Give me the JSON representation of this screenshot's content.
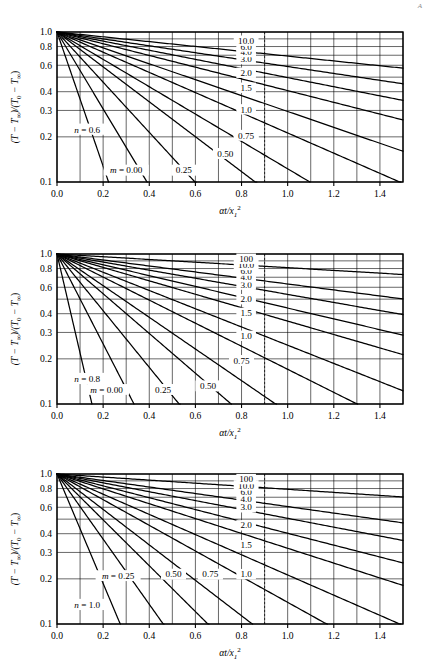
{
  "page": {
    "corner_mark": "A"
  },
  "axes": {
    "ylabel": "(T − T∞)/(T0 − T∞)",
    "xlabel": "αt/x1²",
    "ylabel_parts": {
      "t1": "(T − T",
      "sub1": "∞",
      "t2": ")/(T",
      "sub2": "0",
      "t3": " − T",
      "sub3": "∞",
      "t4": ")"
    },
    "xlabel_parts": {
      "alpha_t": "αt/x",
      "sub": "1",
      "sup": "2"
    },
    "y_ticks": [
      "1.0",
      "0.8",
      "0.6",
      "0.4",
      "0.3",
      "0.2",
      "0.1"
    ],
    "y_tick_values": [
      1.0,
      0.8,
      0.6,
      0.4,
      0.3,
      0.2,
      0.1
    ],
    "x_ticks": [
      "0.0",
      "0.2",
      "0.4",
      "0.6",
      "0.8",
      "1.0",
      "1.2",
      "1.4"
    ],
    "x_tick_values": [
      0.0,
      0.2,
      0.4,
      0.6,
      0.8,
      1.0,
      1.2,
      1.4
    ],
    "xlim": [
      0.0,
      1.5
    ],
    "ylim": [
      0.1,
      1.0
    ],
    "yscale": "log",
    "xgrid_step": 0.1,
    "ygrid_values": [
      0.1,
      0.2,
      0.3,
      0.4,
      0.5,
      0.6,
      0.7,
      0.8,
      0.9,
      1.0
    ],
    "m_prefix": "m = ",
    "n_prefix": "n = "
  },
  "chart_data": [
    {
      "type": "line",
      "id": "chart-n-0-6",
      "title": "n = 0.6",
      "n": "0.6",
      "xlabel": "αt/x1²",
      "ylabel": "(T − T∞)/(T0 − T∞)",
      "xlim": [
        0.0,
        1.5
      ],
      "ylim": [
        0.1,
        1.0
      ],
      "yscale": "log",
      "grid": true,
      "legend": "inline-curve-labels",
      "label_column_x": 0.9,
      "curve_labels": [
        "10.0",
        "6.0",
        "4.0",
        "3.0",
        "2.0",
        "1.5",
        "1.0",
        "0.75",
        "0.50",
        "0.25",
        "0.00"
      ],
      "m_labels_on_axis": [
        "0.00",
        "0.25",
        "0.50",
        "0.75"
      ],
      "series": [
        {
          "name": "0.00",
          "m": 0.0,
          "label_x": 0.3,
          "label_y": 0.12,
          "x_end": 0.365,
          "y_end": 0.1,
          "decay": 10.3
        },
        {
          "name": "0.25",
          "m": 0.25,
          "label_x": 0.55,
          "label_y": 0.12,
          "x_end": 0.625,
          "y_end": 0.1,
          "decay": 5.9
        },
        {
          "name": "0.50",
          "m": 0.5,
          "label_x": 0.73,
          "label_y": 0.155,
          "x_end": 0.92,
          "y_end": 0.1,
          "decay": 3.85
        },
        {
          "name": "0.75",
          "m": 0.75,
          "label_x": 0.82,
          "label_y": 0.205,
          "x_end": 1.26,
          "y_end": 0.1,
          "decay": 2.68
        },
        {
          "name": "1.0",
          "m": 1.0,
          "label_x": 0.82,
          "label_y": 0.305,
          "x_end": 1.5,
          "y_end": 0.115,
          "decay": 2.1
        },
        {
          "name": "1.5",
          "m": 1.5,
          "label_x": 0.82,
          "label_y": 0.425,
          "x_end": 1.5,
          "y_end": 0.2,
          "decay": 1.55
        },
        {
          "name": "2.0",
          "m": 2.0,
          "label_x": 0.82,
          "label_y": 0.535,
          "x_end": 1.5,
          "y_end": 0.3,
          "decay": 1.22
        },
        {
          "name": "3.0",
          "m": 3.0,
          "label_x": 0.82,
          "label_y": 0.66,
          "x_end": 1.5,
          "y_end": 0.435,
          "decay": 0.9
        },
        {
          "name": "4.0",
          "m": 4.0,
          "label_x": 0.82,
          "label_y": 0.735,
          "x_end": 1.5,
          "y_end": 0.535,
          "decay": 0.7
        },
        {
          "name": "6.0",
          "m": 6.0,
          "label_x": 0.82,
          "label_y": 0.8,
          "x_end": 1.5,
          "y_end": 0.64,
          "decay": 0.53
        },
        {
          "name": "10.0",
          "m": 10.0,
          "label_x": 0.82,
          "label_y": 0.875,
          "x_end": 1.5,
          "y_end": 0.76,
          "decay": 0.37
        }
      ]
    },
    {
      "type": "line",
      "id": "chart-n-0-8",
      "title": "n = 0.8",
      "n": "0.8",
      "xlabel": "αt/x1²",
      "ylabel": "(T − T∞)/(T0 − T∞)",
      "xlim": [
        0.0,
        1.5
      ],
      "ylim": [
        0.1,
        1.0
      ],
      "yscale": "log",
      "grid": true,
      "legend": "inline-curve-labels",
      "label_column_x": 0.9,
      "curve_labels": [
        "100",
        "10.0",
        "6.0",
        "4.0",
        "3.0",
        "2.0",
        "1.5",
        "1.0",
        "0.75",
        "0.50",
        "0.25",
        "0.00"
      ],
      "m_labels_on_axis": [
        "0.00",
        "0.25",
        "0.50",
        "0.75"
      ],
      "series": [
        {
          "name": "0.00",
          "m": 0.0,
          "label_x": 0.215,
          "label_y": 0.125,
          "x_end": 0.25,
          "y_end": 0.1,
          "decay": 15.2
        },
        {
          "name": "0.25",
          "m": 0.25,
          "label_x": 0.46,
          "label_y": 0.125,
          "x_end": 0.545,
          "y_end": 0.1,
          "decay": 6.9
        },
        {
          "name": "0.50",
          "m": 0.5,
          "label_x": 0.655,
          "label_y": 0.132,
          "x_end": 0.83,
          "y_end": 0.1,
          "decay": 4.35
        },
        {
          "name": "0.75",
          "m": 0.75,
          "label_x": 0.8,
          "label_y": 0.195,
          "x_end": 1.13,
          "y_end": 0.1,
          "decay": 3.05
        },
        {
          "name": "1.0",
          "m": 1.0,
          "label_x": 0.82,
          "label_y": 0.285,
          "x_end": 1.41,
          "y_end": 0.1,
          "decay": 2.43
        },
        {
          "name": "1.5",
          "m": 1.5,
          "label_x": 0.82,
          "label_y": 0.405,
          "x_end": 1.5,
          "y_end": 0.155,
          "decay": 1.77
        },
        {
          "name": "2.0",
          "m": 2.0,
          "label_x": 0.82,
          "label_y": 0.5,
          "x_end": 1.5,
          "y_end": 0.245,
          "decay": 1.4
        },
        {
          "name": "3.0",
          "m": 3.0,
          "label_x": 0.82,
          "label_y": 0.625,
          "x_end": 1.5,
          "y_end": 0.385,
          "decay": 1.03
        },
        {
          "name": "4.0",
          "m": 4.0,
          "label_x": 0.82,
          "label_y": 0.7,
          "x_end": 1.5,
          "y_end": 0.475,
          "decay": 0.83
        },
        {
          "name": "6.0",
          "m": 6.0,
          "label_x": 0.82,
          "label_y": 0.775,
          "x_end": 1.5,
          "y_end": 0.6,
          "decay": 0.62
        },
        {
          "name": "10.0",
          "m": 10.0,
          "label_x": 0.82,
          "label_y": 0.845,
          "x_end": 1.5,
          "y_end": 0.715,
          "decay": 0.46
        },
        {
          "name": "100",
          "m": 100.0,
          "label_x": 0.82,
          "label_y": 0.93,
          "x_end": 1.5,
          "y_end": 0.875,
          "decay": 0.21
        }
      ]
    },
    {
      "type": "line",
      "id": "chart-n-1-0",
      "title": "n = 1.0",
      "n": "1.0",
      "xlabel": "αt/x1²",
      "ylabel": "(T − T∞)/(T0 − T∞)",
      "xlim": [
        0.0,
        1.5
      ],
      "ylim": [
        0.1,
        1.0
      ],
      "yscale": "log",
      "grid": true,
      "legend": "inline-curve-labels",
      "label_column_x": 0.9,
      "curve_labels": [
        "100",
        "10.0",
        "6.0",
        "4.0",
        "3.0",
        "2.0",
        "1.5",
        "1.0",
        "0.75",
        "0.50",
        "0.25"
      ],
      "m_labels_on_axis": [
        "0.25",
        "0.50",
        "0.75"
      ],
      "series": [
        {
          "name": "0.25",
          "m": 0.25,
          "label_x": 0.265,
          "label_y": 0.21,
          "x_end": 0.4,
          "y_end": 0.1,
          "decay": 8.4
        },
        {
          "name": "0.50",
          "m": 0.5,
          "label_x": 0.505,
          "label_y": 0.215,
          "x_end": 0.7,
          "y_end": 0.1,
          "decay": 5.0
        },
        {
          "name": "0.75",
          "m": 0.75,
          "label_x": 0.665,
          "label_y": 0.215,
          "x_end": 0.985,
          "y_end": 0.1,
          "decay": 3.52
        },
        {
          "name": "1.0",
          "m": 1.0,
          "label_x": 0.82,
          "label_y": 0.215,
          "x_end": 1.28,
          "y_end": 0.1,
          "decay": 2.72
        },
        {
          "name": "1.5",
          "m": 1.5,
          "label_x": 0.82,
          "label_y": 0.335,
          "x_end": 1.5,
          "y_end": 0.145,
          "decay": 1.97
        },
        {
          "name": "2.0",
          "m": 2.0,
          "label_x": 0.82,
          "label_y": 0.455,
          "x_end": 1.5,
          "y_end": 0.225,
          "decay": 1.55
        },
        {
          "name": "3.0",
          "m": 3.0,
          "label_x": 0.82,
          "label_y": 0.6,
          "x_end": 1.5,
          "y_end": 0.355,
          "decay": 1.14
        },
        {
          "name": "4.0",
          "m": 4.0,
          "label_x": 0.82,
          "label_y": 0.685,
          "x_end": 1.5,
          "y_end": 0.455,
          "decay": 0.91
        },
        {
          "name": "6.0",
          "m": 6.0,
          "label_x": 0.82,
          "label_y": 0.765,
          "x_end": 1.5,
          "y_end": 0.58,
          "decay": 0.68
        },
        {
          "name": "10.0",
          "m": 10.0,
          "label_x": 0.82,
          "label_y": 0.84,
          "x_end": 1.5,
          "y_end": 0.7,
          "decay": 0.5
        },
        {
          "name": "100",
          "m": 100.0,
          "label_x": 0.82,
          "label_y": 0.925,
          "x_end": 1.5,
          "y_end": 0.865,
          "decay": 0.235
        }
      ]
    }
  ]
}
